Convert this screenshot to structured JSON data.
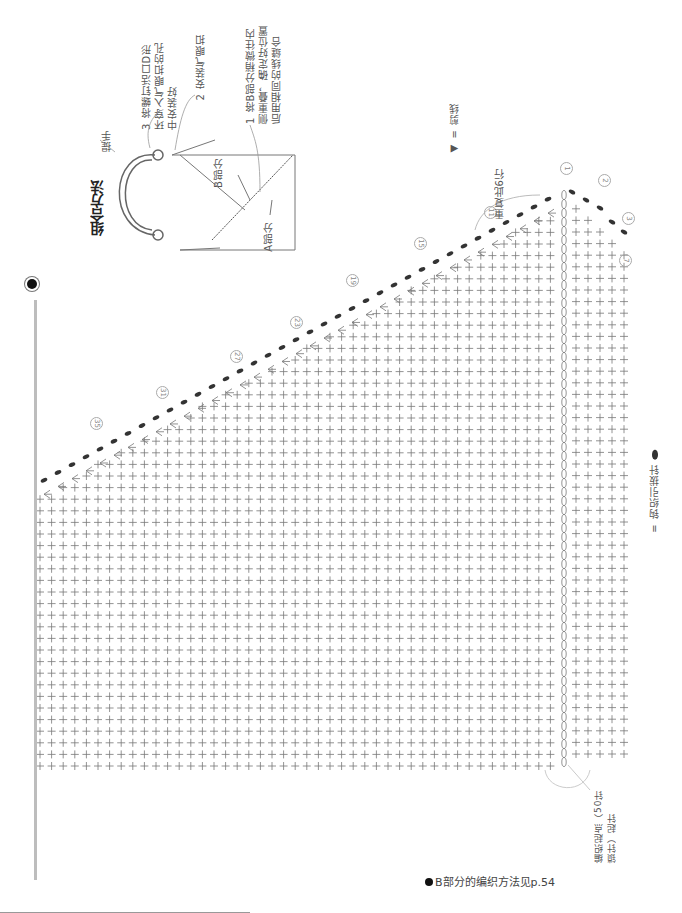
{
  "assembly": {
    "title": "组合方法",
    "handle_label": "提手",
    "part_a_label": "A部分",
    "part_b_label": "B部分",
    "step1": "1 将B部分稍微往内侧重叠，确定好位置后用相同的线缝合",
    "step2": "2 安装气眼扣",
    "step3": "3 将螺钉活口D形环穿入气眼扣的孔中安装好"
  },
  "legend": {
    "cut_yarn": "◀ = 剪线",
    "slip_stitch": "= 钩织引拔针"
  },
  "chart": {
    "repeat_note": "重复此6行",
    "start_note": "编织起点（50针锁针）起针",
    "row_markers": [
      "1",
      "2",
      "3",
      "7",
      "11",
      "15",
      "19",
      "23",
      "27",
      "31",
      "35"
    ],
    "stitch_symbol": "+",
    "foundation_columns": 50
  },
  "footer": {
    "note": "B部分的编织方法见p.54"
  }
}
